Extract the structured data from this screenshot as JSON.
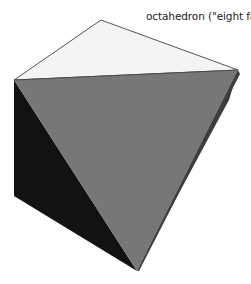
{
  "diagram": {
    "label": "octahedron (\"eight faces\")",
    "shape": "octahedron",
    "vertices": {
      "top": [
        101,
        20
      ],
      "left": [
        14,
        80
      ],
      "right": [
        238,
        70
      ],
      "left_bottom": [
        14,
        196
      ],
      "right_mid": [
        200,
        190
      ],
      "bottom": [
        137,
        271
      ]
    },
    "colors": {
      "top_face": "#f4f4f4",
      "front_face": "#777777",
      "left_face": "#121212",
      "right_face": "#3e3e3e",
      "edge": "#555555"
    }
  }
}
